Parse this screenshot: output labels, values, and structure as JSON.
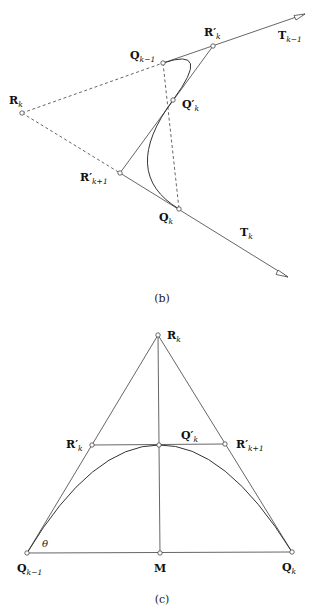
{
  "diagram_b": {
    "caption": "(b)",
    "labels": {
      "Qkm1": {
        "main": "Q",
        "sub": "k−1"
      },
      "Rpk": {
        "main": "R′",
        "sub": "k"
      },
      "Tkm1": {
        "main": "T",
        "sub": "k−1"
      },
      "Rk": {
        "main": "R",
        "sub": "k"
      },
      "Qpk": {
        "main": "Q′",
        "sub": "k"
      },
      "Rpk1": {
        "main": "R′",
        "sub": "k+1"
      },
      "Qk": {
        "main": "Q",
        "sub": "k"
      },
      "Tk": {
        "main": "T",
        "sub": "k"
      }
    }
  },
  "diagram_c": {
    "caption": "(c)",
    "angle_label": "θ",
    "labels": {
      "Rk": {
        "main": "R",
        "sub": "k"
      },
      "Rpk": {
        "main": "R′",
        "sub": "k"
      },
      "Qpk": {
        "main": "Q′",
        "sub": "k"
      },
      "Rpk1": {
        "main": "R′",
        "sub": "k+1"
      },
      "Qkm1": {
        "main": "Q",
        "sub": "k−1"
      },
      "M": {
        "main": "M",
        "sub": ""
      },
      "Qk": {
        "main": "Q",
        "sub": "k"
      }
    }
  }
}
